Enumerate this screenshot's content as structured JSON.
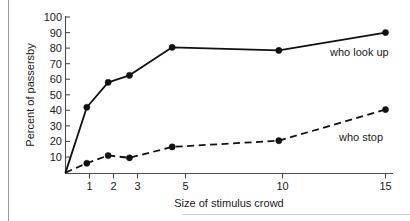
{
  "chart_data": {
    "type": "line",
    "title": "",
    "xlabel": "Size of stimulus crowd",
    "ylabel": "Percent of passersby",
    "x": [
      0,
      1,
      2,
      3,
      5,
      10,
      15
    ],
    "xtick_labels": [
      "1",
      "2",
      "3",
      "5",
      "10",
      "15"
    ],
    "xtick_values": [
      1,
      2,
      3,
      5,
      10,
      15
    ],
    "ytick_labels": [
      "10",
      "20",
      "30",
      "40",
      "50",
      "60",
      "70",
      "80",
      "90",
      "100"
    ],
    "ytick_values": [
      10,
      20,
      30,
      40,
      50,
      60,
      70,
      80,
      90,
      100
    ],
    "ylim": [
      0,
      100
    ],
    "grid": false,
    "legend_position": "inline-right",
    "series": [
      {
        "name": "who look up",
        "style": "solid",
        "color": "#111111",
        "x": [
          0,
          1,
          2,
          3,
          5,
          10,
          15
        ],
        "values": [
          0,
          42,
          58,
          62.5,
          80.5,
          78.5,
          90
        ],
        "label": "who look up"
      },
      {
        "name": "who stop",
        "style": "dashed",
        "color": "#111111",
        "x": [
          0,
          1,
          2,
          3,
          5,
          10,
          15
        ],
        "values": [
          0,
          6,
          11,
          9.5,
          16.5,
          20.5,
          40.5
        ],
        "label": "who stop"
      }
    ]
  },
  "axes": {
    "y_title": "Percent of passersby",
    "x_title": "Size of stimulus crowd"
  },
  "labels": {
    "look_up": "who look up",
    "stop": "who stop"
  },
  "yticks": [
    {
      "label": "100"
    },
    {
      "label": "90"
    },
    {
      "label": "80"
    },
    {
      "label": "70"
    },
    {
      "label": "60"
    },
    {
      "label": "50"
    },
    {
      "label": "40"
    },
    {
      "label": "30"
    },
    {
      "label": "20"
    },
    {
      "label": "10"
    }
  ],
  "xticks": [
    {
      "label": "1"
    },
    {
      "label": "2"
    },
    {
      "label": "3"
    },
    {
      "label": "5"
    },
    {
      "label": "10"
    },
    {
      "label": "15"
    }
  ]
}
